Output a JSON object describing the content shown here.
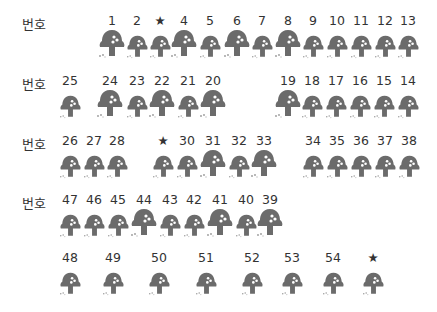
{
  "row_label": "번호",
  "rows": [
    {
      "label_y": 14,
      "num_y": 14,
      "cells": [
        {
          "text": "1",
          "x": 112,
          "size": "L"
        },
        {
          "text": "2",
          "x": 137,
          "size": "S"
        },
        {
          "text": "★",
          "x": 160,
          "size": "S"
        },
        {
          "text": "4",
          "x": 184,
          "size": "L"
        },
        {
          "text": "5",
          "x": 210,
          "size": "S"
        },
        {
          "text": "6",
          "x": 237,
          "size": "L"
        },
        {
          "text": "7",
          "x": 262,
          "size": "S"
        },
        {
          "text": "8",
          "x": 288,
          "size": "L"
        },
        {
          "text": "9",
          "x": 313,
          "size": "S"
        },
        {
          "text": "10",
          "x": 337,
          "size": "S"
        },
        {
          "text": "11",
          "x": 361,
          "size": "S"
        },
        {
          "text": "12",
          "x": 385,
          "size": "S"
        },
        {
          "text": "13",
          "x": 408,
          "size": "S"
        }
      ]
    },
    {
      "label_y": 74,
      "num_y": 74,
      "cells": [
        {
          "text": "25",
          "x": 70,
          "size": "S"
        },
        {
          "text": "24",
          "x": 110,
          "size": "L"
        },
        {
          "text": "23",
          "x": 137,
          "size": "S"
        },
        {
          "text": "22",
          "x": 162,
          "size": "L"
        },
        {
          "text": "21",
          "x": 188,
          "size": "S"
        },
        {
          "text": "20",
          "x": 213,
          "size": "L"
        },
        {
          "text": "19",
          "x": 288,
          "size": "L"
        },
        {
          "text": "18",
          "x": 312,
          "size": "S"
        },
        {
          "text": "17",
          "x": 336,
          "size": "S"
        },
        {
          "text": "16",
          "x": 360,
          "size": "S"
        },
        {
          "text": "15",
          "x": 384,
          "size": "S"
        },
        {
          "text": "14",
          "x": 408,
          "size": "S"
        }
      ]
    },
    {
      "label_y": 134,
      "num_y": 134,
      "cells": [
        {
          "text": "26",
          "x": 70,
          "size": "S"
        },
        {
          "text": "27",
          "x": 94,
          "size": "S"
        },
        {
          "text": "28",
          "x": 117,
          "size": "S"
        },
        {
          "text": "★",
          "x": 163,
          "size": "S"
        },
        {
          "text": "30",
          "x": 187,
          "size": "S"
        },
        {
          "text": "31",
          "x": 213,
          "size": "L"
        },
        {
          "text": "32",
          "x": 239,
          "size": "S"
        },
        {
          "text": "33",
          "x": 264,
          "size": "L"
        },
        {
          "text": "34",
          "x": 313,
          "size": "S"
        },
        {
          "text": "35",
          "x": 337,
          "size": "S"
        },
        {
          "text": "36",
          "x": 361,
          "size": "S"
        },
        {
          "text": "37",
          "x": 385,
          "size": "S"
        },
        {
          "text": "38",
          "x": 409,
          "size": "S"
        }
      ]
    },
    {
      "label_y": 193,
      "num_y": 193,
      "cells": [
        {
          "text": "47",
          "x": 70,
          "size": "S"
        },
        {
          "text": "46",
          "x": 94,
          "size": "S"
        },
        {
          "text": "45",
          "x": 118,
          "size": "S"
        },
        {
          "text": "44",
          "x": 144,
          "size": "L"
        },
        {
          "text": "43",
          "x": 170,
          "size": "S"
        },
        {
          "text": "42",
          "x": 194,
          "size": "S"
        },
        {
          "text": "41",
          "x": 220,
          "size": "L"
        },
        {
          "text": "40",
          "x": 246,
          "size": "S"
        },
        {
          "text": "39",
          "x": 270,
          "size": "L"
        }
      ]
    },
    {
      "label_y": null,
      "num_y": 251,
      "cells": [
        {
          "text": "48",
          "x": 70,
          "size": "S"
        },
        {
          "text": "49",
          "x": 113,
          "size": "S"
        },
        {
          "text": "50",
          "x": 159,
          "size": "S"
        },
        {
          "text": "51",
          "x": 206,
          "size": "S"
        },
        {
          "text": "52",
          "x": 252,
          "size": "S"
        },
        {
          "text": "53",
          "x": 292,
          "size": "S"
        },
        {
          "text": "54",
          "x": 333,
          "size": "S"
        },
        {
          "text": "★",
          "x": 373,
          "size": "S"
        }
      ]
    }
  ],
  "colors": {
    "mushroom": "#6b6b6b",
    "dots": "#ffffff",
    "text": "#333333"
  }
}
